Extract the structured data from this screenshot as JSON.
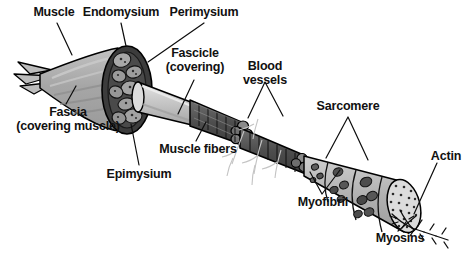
{
  "figure": {
    "background_color": "#ffffff",
    "text_color": "#111111",
    "line_color": "#000000",
    "palette": {
      "muscle_belly": "#a9a9a9",
      "muscle_belly_light": "#c9c9c9",
      "sheath_dark": "#3a3a3a",
      "fascicle_fill": "#9a9a9a",
      "fascicle_cylinder": "#d0d0d0",
      "fiber_dark": "#4a4a4a",
      "fiber_mid": "#6e6e6e",
      "myofibril_light": "#bdbdbd",
      "myofibril_spot": "#5a5a5a",
      "actin_fill": "#d6d6d6",
      "vessel_line": "#bdbdbd"
    }
  },
  "labels": [
    {
      "id": "muscle",
      "text": "Muscle",
      "x": 28,
      "y": 6,
      "width": 52
    },
    {
      "id": "endomysium",
      "text": "Endomysium",
      "x": 82,
      "y": 6,
      "width": 78
    },
    {
      "id": "perimysium",
      "text": "Perimysium",
      "x": 166,
      "y": 6,
      "width": 76
    },
    {
      "id": "fascicle",
      "text": "Fascicle\n(covering)",
      "x": 160,
      "y": 47,
      "width": 70
    },
    {
      "id": "blood-vessels",
      "text": "Blood\nvessels",
      "x": 239,
      "y": 60,
      "width": 52
    },
    {
      "id": "sarcomere",
      "text": "Sarcomere",
      "x": 314,
      "y": 100,
      "width": 68
    },
    {
      "id": "fascia",
      "text": "Fascia\n(covering muscle)",
      "x": 6,
      "y": 106,
      "width": 124
    },
    {
      "id": "muscle-fibers",
      "text": "Muscle fibers",
      "x": 155,
      "y": 143,
      "width": 86
    },
    {
      "id": "epimysium",
      "text": "Epimysium",
      "x": 104,
      "y": 168,
      "width": 70
    },
    {
      "id": "myofibril",
      "text": "Myofibril",
      "x": 292,
      "y": 196,
      "width": 62
    },
    {
      "id": "actin",
      "text": "Actin",
      "x": 428,
      "y": 150,
      "width": 36
    },
    {
      "id": "myosins",
      "text": "Myosins",
      "x": 373,
      "y": 232,
      "width": 54
    }
  ],
  "structures": [
    {
      "id": "whole-muscle",
      "name": "whole muscle belly with tendon"
    },
    {
      "id": "epimysium-ring",
      "name": "epimysium cross-section ring"
    },
    {
      "id": "fascicle-cylinder",
      "name": "fascicle covering cylinder"
    },
    {
      "id": "muscle-fiber-bundle",
      "name": "muscle fiber bundle"
    },
    {
      "id": "blood-vessel-net",
      "name": "blood vessel filaments"
    },
    {
      "id": "myofibril-cone",
      "name": "myofibril expanding cone"
    },
    {
      "id": "actin-disc",
      "name": "actin filament cross-section"
    },
    {
      "id": "myosin-filaments",
      "name": "myosin branching filaments"
    }
  ]
}
